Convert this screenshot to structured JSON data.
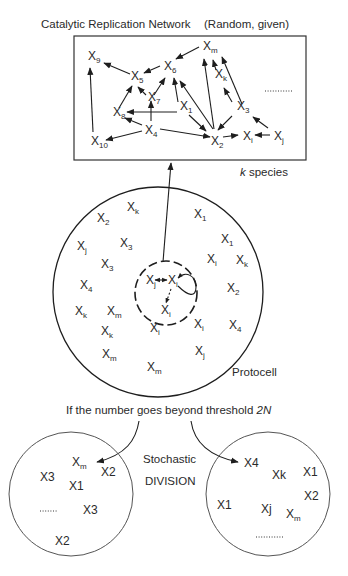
{
  "title": "Catalytic Replication Network",
  "title_note": "(Random, given)",
  "network_box_label_prefix": "k",
  "network_box_label_suffix": " species",
  "network_nodes": [
    {
      "id": "X9",
      "base": "X",
      "sub": "9",
      "x": 88,
      "y": 60
    },
    {
      "id": "X6",
      "base": "X",
      "sub": "6",
      "x": 164,
      "y": 70
    },
    {
      "id": "Xm",
      "base": "X",
      "sub": "m",
      "x": 203,
      "y": 50
    },
    {
      "id": "X5",
      "base": "X",
      "sub": "5",
      "x": 131,
      "y": 80
    },
    {
      "id": "Xk",
      "base": "X",
      "sub": "k",
      "x": 215,
      "y": 78
    },
    {
      "id": "X7",
      "base": "X",
      "sub": "7",
      "x": 148,
      "y": 101
    },
    {
      "id": "X1",
      "base": "X",
      "sub": "1",
      "x": 180,
      "y": 110
    },
    {
      "id": "X3",
      "base": "X",
      "sub": "3",
      "x": 237,
      "y": 110
    },
    {
      "id": "X8",
      "base": "X",
      "sub": "8",
      "x": 113,
      "y": 113
    },
    {
      "id": "X4",
      "base": "X",
      "sub": "4",
      "x": 148,
      "y": 130
    },
    {
      "id": "X10",
      "base": "X",
      "sub": "10",
      "x": 91,
      "y": 141
    },
    {
      "id": "X2",
      "base": "X",
      "sub": "2",
      "x": 213,
      "y": 141
    },
    {
      "id": "Xi",
      "base": "X",
      "sub": "i",
      "x": 243,
      "y": 139
    },
    {
      "id": "Xj",
      "base": "X",
      "sub": "j",
      "x": 274,
      "y": 139
    }
  ],
  "network_ellipsis": "...........",
  "protocell_label": "Protocell",
  "protocell_molecules": [
    {
      "base": "X",
      "sub": "k",
      "x": 127,
      "y": 211
    },
    {
      "base": "X",
      "sub": "2",
      "x": 97,
      "y": 222
    },
    {
      "base": "X",
      "sub": "1",
      "x": 194,
      "y": 218
    },
    {
      "base": "X",
      "sub": "1",
      "x": 221,
      "y": 243
    },
    {
      "base": "X",
      "sub": "j",
      "x": 77,
      "y": 250
    },
    {
      "base": "X",
      "sub": "3",
      "x": 120,
      "y": 247
    },
    {
      "base": "X",
      "sub": "3",
      "x": 101,
      "y": 268
    },
    {
      "base": "X",
      "sub": "i",
      "x": 207,
      "y": 263
    },
    {
      "base": "X",
      "sub": "k",
      "x": 236,
      "y": 264
    },
    {
      "base": "X",
      "sub": "4",
      "x": 80,
      "y": 289
    },
    {
      "base": "X",
      "sub": "2",
      "x": 227,
      "y": 292
    },
    {
      "base": "X",
      "sub": "k",
      "x": 75,
      "y": 315
    },
    {
      "base": "X",
      "sub": "m",
      "x": 107,
      "y": 315
    },
    {
      "base": "X",
      "sub": "k",
      "x": 101,
      "y": 335
    },
    {
      "base": "X",
      "sub": "i",
      "x": 150,
      "y": 332
    },
    {
      "base": "X",
      "sub": "i",
      "x": 194,
      "y": 328
    },
    {
      "base": "X",
      "sub": "4",
      "x": 229,
      "y": 329
    },
    {
      "base": "X",
      "sub": "m",
      "x": 102,
      "y": 358
    },
    {
      "base": "X",
      "sub": "j",
      "x": 195,
      "y": 355
    },
    {
      "base": "X",
      "sub": "m",
      "x": 147,
      "y": 371
    }
  ],
  "replication_zone": [
    {
      "base": "X",
      "sub": "j",
      "x": 146,
      "y": 282
    },
    {
      "base": "X",
      "sub": "i",
      "x": 171,
      "y": 282
    },
    {
      "base": "X",
      "sub": "i",
      "x": 164,
      "y": 312
    }
  ],
  "threshold_text": "If the number goes beyond threshold ",
  "threshold_value": "2N",
  "division_line1": "Stochastic",
  "division_line2": "DIVISION",
  "daughter_left": {
    "molecules": [
      {
        "base": "X",
        "sub": "m",
        "x": 72,
        "y": 466
      },
      {
        "base": "X2",
        "sub": "",
        "x": 101,
        "y": 476
      },
      {
        "base": "X3",
        "sub": "",
        "x": 40,
        "y": 481
      },
      {
        "base": "X1",
        "sub": "",
        "x": 69,
        "y": 490
      },
      {
        "base": "X3",
        "sub": "",
        "x": 83,
        "y": 514
      },
      {
        "base": "X2",
        "sub": "",
        "x": 55,
        "y": 545
      }
    ],
    "ellipsis": "........"
  },
  "daughter_right": {
    "molecules": [
      {
        "base": "X4",
        "sub": "",
        "x": 244,
        "y": 466
      },
      {
        "base": "Xk",
        "sub": "",
        "x": 272,
        "y": 478
      },
      {
        "base": "X1",
        "sub": "",
        "x": 303,
        "y": 475
      },
      {
        "base": "X2",
        "sub": "",
        "x": 304,
        "y": 499
      },
      {
        "base": "X1",
        "sub": "",
        "x": 217,
        "y": 508
      },
      {
        "base": "Xj",
        "sub": "",
        "x": 261,
        "y": 512
      },
      {
        "base": "X",
        "sub": "m",
        "x": 286,
        "y": 518
      }
    ],
    "ellipsis": "..........."
  }
}
